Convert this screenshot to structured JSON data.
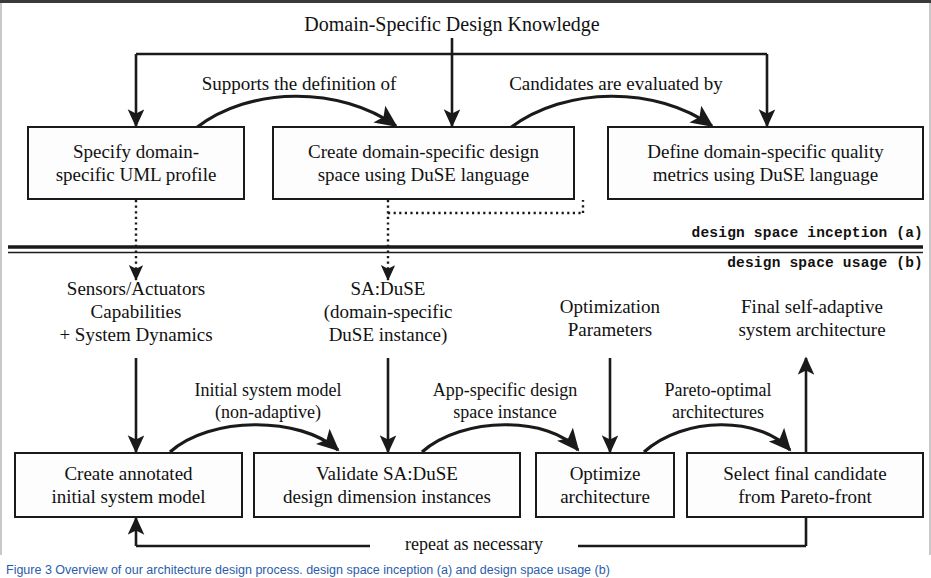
{
  "figure": {
    "title_top": "Domain-Specific Design Knowledge",
    "divider_label_upper": "design space inception (a)",
    "divider_label_lower": "design space usage (b)",
    "feedback_label": "repeat as necessary",
    "caption": "Figure 3 Overview of our architecture design process. design space inception (a) and design space usage (b)"
  },
  "edge_labels": {
    "supports": "Supports the definition of",
    "candidates": "Candidates are evaluated by",
    "initial_system_model": "Initial system model\n(non-adaptive)",
    "app_specific_instance": "App-specific design\nspace instance",
    "pareto_optimal": "Pareto-optimal\narchitectures"
  },
  "inception": {
    "nodes": [
      {
        "id": "specify-uml-profile",
        "text": "Specify domain-\nspecific UML profile"
      },
      {
        "id": "create-design-space",
        "text": "Create domain-specific design\nspace using DuSE language"
      },
      {
        "id": "define-quality-metrics",
        "text": "Define domain-specific quality\nmetrics using DuSE language"
      }
    ]
  },
  "usage": {
    "inputs": [
      {
        "id": "sensors-actuators",
        "text": "Sensors/Actuators\nCapabilities\n+ System Dynamics"
      },
      {
        "id": "sa-duse",
        "text": "SA:DuSE\n(domain-specific\nDuSE instance)"
      },
      {
        "id": "optimization-parameters",
        "text": "Optimization\nParameters"
      },
      {
        "id": "final-architecture",
        "text": "Final self-adaptive\nsystem architecture"
      }
    ],
    "nodes": [
      {
        "id": "create-annotated-model",
        "text": "Create annotated\ninitial system model"
      },
      {
        "id": "validate-sa-duse",
        "text": "Validate SA:DuSE\ndesign dimension instances"
      },
      {
        "id": "optimize-architecture",
        "text": "Optimize\narchitecture"
      },
      {
        "id": "select-final-candidate",
        "text": "Select final candidate\nfrom Pareto-front"
      }
    ]
  },
  "colors": {
    "ink": "#1a1a1a",
    "paper": "#ffffff",
    "caption": "#2a5caa"
  }
}
